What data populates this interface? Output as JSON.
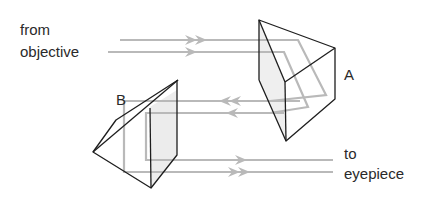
{
  "diagram": {
    "labels": {
      "input_line1": "from",
      "input_line2": "objective",
      "output_line1": "to",
      "output_line2": "eyepiece",
      "prism_a": "A",
      "prism_b": "B"
    },
    "colors": {
      "background": "#ffffff",
      "outline": "#1e1e1e",
      "beam": "#b8b8b8",
      "face_shade": "#ececec",
      "text": "#2a2a2a"
    },
    "nodes": [
      {
        "id": "objective",
        "label": "from objective"
      },
      {
        "id": "prism_a",
        "label": "A"
      },
      {
        "id": "prism_b",
        "label": "B"
      },
      {
        "id": "eyepiece",
        "label": "to eyepiece"
      }
    ],
    "edges": [
      {
        "from": "objective",
        "to": "prism_a",
        "direction": "right",
        "beams": 2
      },
      {
        "from": "prism_a",
        "to": "prism_b",
        "direction": "left",
        "beams": 2
      },
      {
        "from": "prism_b",
        "to": "eyepiece",
        "direction": "right",
        "beams": 2
      }
    ]
  }
}
